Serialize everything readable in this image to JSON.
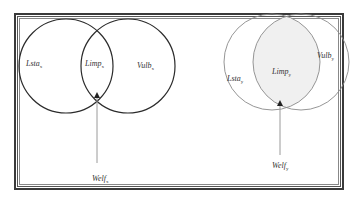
{
  "frame": {
    "style": "double-border"
  },
  "diagrams": [
    {
      "id": "x",
      "style": "dark-outline",
      "sets": [
        {
          "name": "Lsta",
          "sub": "x"
        },
        {
          "name": "Limp",
          "sub": "x"
        },
        {
          "name": "Vulb",
          "sub": "x"
        }
      ],
      "pointer": {
        "name": "Welf",
        "sub": "x"
      }
    },
    {
      "id": "y",
      "style": "light-outline-shaded-intersection",
      "sets": [
        {
          "name": "Lsta",
          "sub": "y"
        },
        {
          "name": "Limp",
          "sub": "y"
        },
        {
          "name": "Vulb",
          "sub": "y"
        }
      ],
      "pointer": {
        "name": "Welf",
        "sub": "y"
      }
    }
  ],
  "colors": {
    "outline_dark": "#2b2b2b",
    "outline_light": "#8a8a8a",
    "intersection_fill": "#f0f0f0",
    "arrow": "#9a9a9a"
  }
}
